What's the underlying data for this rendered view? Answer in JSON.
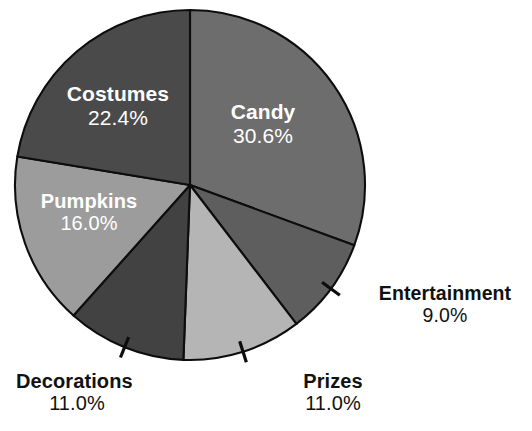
{
  "chart_data": {
    "type": "pie",
    "title": "",
    "subtitle": "",
    "xlabel": "",
    "ylabel": "",
    "legend_position": "none",
    "grid": false,
    "label_format": "name + percent",
    "start_angle_deg": 0,
    "direction": "clockwise",
    "categories": [
      "Candy",
      "Entertainment",
      "Prizes",
      "Decorations",
      "Pumpkins",
      "Costumes"
    ],
    "values": [
      30.6,
      9.0,
      11.0,
      11.0,
      16.0,
      22.4
    ],
    "units": "percent",
    "total": 100.0,
    "slices": [
      {
        "label": "Candy",
        "percent": 30.6,
        "percent_text": "30.6%",
        "color": "#6d6d6d",
        "label_placement": "inside",
        "label_color": "#ffffff",
        "start_angle_deg": 0.0,
        "end_angle_deg": 110.16
      },
      {
        "label": "Entertainment",
        "percent": 9.0,
        "percent_text": "9.0%",
        "color": "#5e5e5e",
        "label_placement": "outside",
        "label_color": "#111111",
        "has_leader_tick": true,
        "start_angle_deg": 110.16,
        "end_angle_deg": 142.56
      },
      {
        "label": "Prizes",
        "percent": 11.0,
        "percent_text": "11.0%",
        "color": "#b5b5b5",
        "label_placement": "outside",
        "label_color": "#111111",
        "has_leader_tick": true,
        "start_angle_deg": 142.56,
        "end_angle_deg": 182.16
      },
      {
        "label": "Decorations",
        "percent": 11.0,
        "percent_text": "11.0%",
        "color": "#424242",
        "label_placement": "outside",
        "label_color": "#111111",
        "has_leader_tick": true,
        "start_angle_deg": 182.16,
        "end_angle_deg": 221.76
      },
      {
        "label": "Pumpkins",
        "percent": 16.0,
        "percent_text": "16.0%",
        "color": "#9c9c9c",
        "label_placement": "inside",
        "label_color": "#ffffff",
        "start_angle_deg": 221.76,
        "end_angle_deg": 279.36
      },
      {
        "label": "Costumes",
        "percent": 22.4,
        "percent_text": "22.4%",
        "color": "#4a4a4a",
        "label_placement": "inside",
        "label_color": "#ffffff",
        "start_angle_deg": 279.36,
        "end_angle_deg": 360.0
      }
    ],
    "geometry": {
      "center_x": 190,
      "center_y": 185,
      "radius": 175
    },
    "style": {
      "background": "#ffffff",
      "slice_border": "#0d0d0d",
      "slice_border_width": 2.1
    }
  }
}
